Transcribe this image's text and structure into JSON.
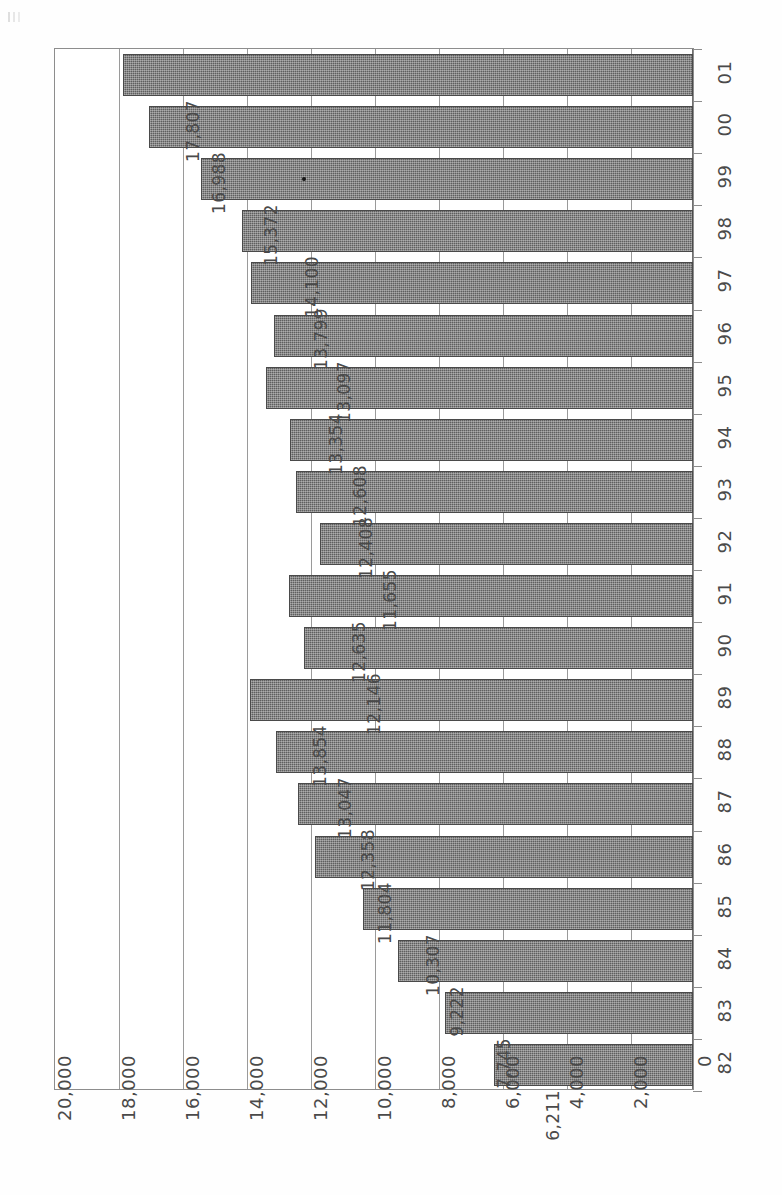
{
  "chart_data": {
    "type": "bar",
    "orientation": "horizontal",
    "title": "",
    "subtitle": "",
    "xlabel": "",
    "ylabel": "",
    "categories": [
      "01",
      "00",
      "99",
      "98",
      "97",
      "96",
      "95",
      "94",
      "93",
      "92",
      "91",
      "90",
      "89",
      "88",
      "87",
      "86",
      "85",
      "84",
      "83",
      "82"
    ],
    "values": [
      17807,
      16988,
      15372,
      14100,
      13799,
      13097,
      13354,
      12608,
      12408,
      11655,
      12635,
      12146,
      13854,
      13047,
      12358,
      11804,
      10307,
      9222,
      7745,
      6211
    ],
    "value_labels": [
      "17,807",
      "16,988",
      "15,372",
      "14,100",
      "13,799",
      "13,097",
      "13,354",
      "12,608",
      "12,408",
      "11,655",
      "12,635",
      "12,146",
      "13,854",
      "13,047",
      "12,358",
      "11,804",
      "10,307",
      "9,222",
      "7,745",
      "6,211"
    ],
    "axis_ticks": [
      20000,
      18000,
      16000,
      14000,
      12000,
      10000,
      8000,
      6000,
      4000,
      2000,
      0
    ],
    "axis_tick_labels": [
      "20,000",
      "18,000",
      "16,000",
      "14,000",
      "12,000",
      "10,000",
      "8,000",
      "6,000",
      "4,000",
      "2,000",
      "0"
    ],
    "xlim": [
      0,
      20000
    ],
    "grid": true,
    "legend": null,
    "legend_position": "none",
    "bar_color": "#5f5f5f",
    "gridline_color": "#9a9a9a",
    "text_color": "#4a4a4a",
    "page_rotation_degrees": -90,
    "annotations": [
      {
        "name": "ink-speck",
        "on_category": "99",
        "description": "small dark print speck inside bar"
      }
    ]
  }
}
